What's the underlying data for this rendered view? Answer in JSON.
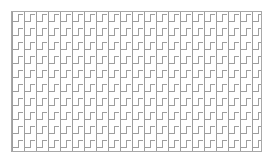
{
  "figure": {
    "canvas": {
      "width": 274,
      "height": 166,
      "background_color": "#ffffff"
    },
    "frame": {
      "name": "outer-border-rectangle",
      "x": 11,
      "y": 11,
      "width": 251,
      "height": 141,
      "stroke_color": "#a8a8a8",
      "stroke_width": 1,
      "fill": "none"
    },
    "pattern": {
      "name": "zigzag-stair-tiling",
      "motif": "interlocking-hook",
      "stroke_color": "#9e9e9e",
      "stroke_width": 1,
      "tile_width": 12,
      "tile_height": 14,
      "columns": 21,
      "rows": 10,
      "row_offset_x": 0,
      "description": "Vertical strokes joined by short horizontal connectors at alternating top and bottom, forming interlocking L and reversed-L hooks repeated across a grid."
    }
  }
}
